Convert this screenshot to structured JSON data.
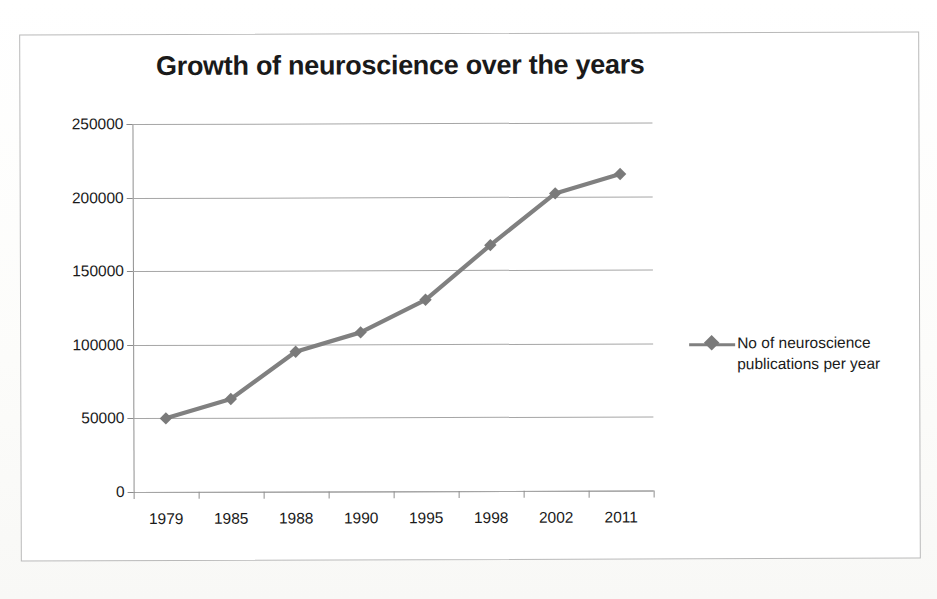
{
  "chart_data": {
    "type": "line",
    "title": "Growth of neuroscience over the years",
    "xlabel": "",
    "ylabel": "",
    "categories": [
      "1979",
      "1985",
      "1988",
      "1990",
      "1995",
      "1998",
      "2002",
      "2011"
    ],
    "series": [
      {
        "name": "No of neuroscience publications per year",
        "values": [
          50000,
          63000,
          95000,
          108000,
          130000,
          167000,
          202000,
          215000
        ]
      }
    ],
    "ylim": [
      0,
      250000
    ],
    "y_ticks": [
      0,
      50000,
      100000,
      150000,
      200000,
      250000
    ],
    "y_tick_labels": [
      "0",
      "50000",
      "100000",
      "150000",
      "200000",
      "250000"
    ],
    "grid": true,
    "legend_position": "right",
    "marker": "diamond",
    "line_color": "#808080",
    "marker_color": "#7a7a7a",
    "grid_color": "#a6a6a6",
    "axis_color": "#8f8f8f",
    "text_color": "#1a1a1a",
    "background": "#ffffff"
  },
  "legend": {
    "entries": [
      {
        "label_line_1": "No of neuroscience",
        "label_line_2": "publications per year",
        "full_label": "No of neuroscience publications per year",
        "swatch": "diamond-line-marker"
      }
    ]
  },
  "frame": {
    "border_color": "#b9b9b9"
  }
}
